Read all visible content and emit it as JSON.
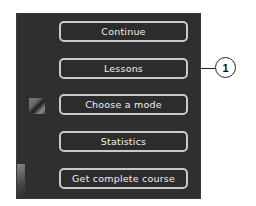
{
  "menu": {
    "items": [
      {
        "label": "Continue"
      },
      {
        "label": "Lessons"
      },
      {
        "label": "Choose a mode"
      },
      {
        "label": "Statistics"
      },
      {
        "label": "Get complete course"
      }
    ]
  },
  "callout": {
    "number": "1",
    "target": "Lessons"
  },
  "colors": {
    "panel_background": "#2f2f2f",
    "button_border": "#c9c9c9",
    "button_text": "#f0f0f0"
  }
}
